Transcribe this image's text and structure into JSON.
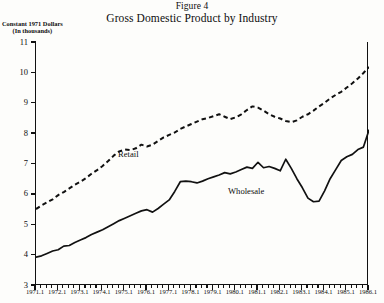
{
  "figure": {
    "number": "Figure 4",
    "title": "Gross Domestic Product by Industry"
  },
  "axes": {
    "y_title_line1": "Constant 1971 Dollars",
    "y_title_line2": "(In thousands)"
  },
  "chart_data": {
    "type": "line",
    "title": "Gross Domestic Product by Industry",
    "subtitle": "Figure 4",
    "xlabel": "",
    "ylabel": "Constant 1971 Dollars (In thousands)",
    "ylim": [
      3,
      11
    ],
    "xlim": [
      "1971.1",
      "1986.1"
    ],
    "y_ticks": [
      3,
      4,
      5,
      6,
      7,
      8,
      9,
      10,
      11
    ],
    "y_tick_labels": [
      "3",
      "4",
      "5",
      "6",
      "7",
      "8",
      "9",
      "10",
      "11"
    ],
    "x_tick_labels": [
      "1971.1",
      "1972.1",
      "1973.1",
      "1974.1",
      "1975.1",
      "1976.1",
      "1977.1",
      "1978.1",
      "1979.1",
      "1980.1",
      "1981.1",
      "1982.1",
      "1983.1",
      "1984.1",
      "1985.1",
      "1986.1"
    ],
    "x_minor_ticks_per_year": 4,
    "grid": false,
    "legend": "inline-annotation",
    "x": [
      "1971.1",
      "1971.2",
      "1971.3",
      "1971.4",
      "1972.1",
      "1972.2",
      "1972.3",
      "1972.4",
      "1973.1",
      "1973.2",
      "1973.3",
      "1973.4",
      "1974.1",
      "1974.2",
      "1974.3",
      "1974.4",
      "1975.1",
      "1975.2",
      "1975.3",
      "1975.4",
      "1976.1",
      "1976.2",
      "1976.3",
      "1976.4",
      "1977.1",
      "1977.2",
      "1977.3",
      "1977.4",
      "1978.1",
      "1978.2",
      "1978.3",
      "1978.4",
      "1979.1",
      "1979.2",
      "1979.3",
      "1979.4",
      "1980.1",
      "1980.2",
      "1980.3",
      "1980.4",
      "1981.1",
      "1981.2",
      "1981.3",
      "1981.4",
      "1982.1",
      "1982.2",
      "1982.3",
      "1982.4",
      "1983.1",
      "1983.2",
      "1983.3",
      "1983.4",
      "1984.1",
      "1984.2",
      "1984.3",
      "1984.4",
      "1985.1",
      "1985.2",
      "1985.3",
      "1985.4",
      "1986.1"
    ],
    "series": [
      {
        "name": "Retail",
        "style": "dashed",
        "color": "#111111",
        "values": [
          5.5,
          5.62,
          5.72,
          5.82,
          5.96,
          6.06,
          6.18,
          6.3,
          6.4,
          6.52,
          6.66,
          6.78,
          6.92,
          7.08,
          7.26,
          7.4,
          7.46,
          7.44,
          7.5,
          7.62,
          7.56,
          7.62,
          7.74,
          7.86,
          7.94,
          8.02,
          8.14,
          8.22,
          8.3,
          8.38,
          8.46,
          8.5,
          8.56,
          8.62,
          8.54,
          8.46,
          8.52,
          8.62,
          8.76,
          8.88,
          8.84,
          8.74,
          8.62,
          8.54,
          8.48,
          8.4,
          8.36,
          8.42,
          8.54,
          8.62,
          8.74,
          8.88,
          9.0,
          9.14,
          9.26,
          9.36,
          9.5,
          9.64,
          9.8,
          9.98,
          10.18
        ]
      },
      {
        "name": "Wholesale",
        "style": "solid",
        "color": "#111111",
        "values": [
          3.92,
          3.96,
          4.04,
          4.12,
          4.16,
          4.28,
          4.3,
          4.4,
          4.48,
          4.56,
          4.66,
          4.74,
          4.82,
          4.92,
          5.02,
          5.12,
          5.2,
          5.28,
          5.36,
          5.44,
          5.48,
          5.4,
          5.52,
          5.66,
          5.8,
          6.08,
          6.4,
          6.42,
          6.4,
          6.36,
          6.42,
          6.5,
          6.56,
          6.62,
          6.7,
          6.66,
          6.72,
          6.8,
          6.88,
          6.84,
          7.04,
          6.86,
          6.9,
          6.84,
          6.76,
          7.14,
          6.84,
          6.5,
          6.2,
          5.86,
          5.74,
          5.76,
          6.1,
          6.5,
          6.8,
          7.1,
          7.22,
          7.3,
          7.46,
          7.54,
          8.1
        ]
      }
    ],
    "annotations": [
      {
        "text": "Retail",
        "x": "1975.2",
        "y": 7.92
      },
      {
        "text": "Wholesale",
        "x": "1981.2",
        "y": 6.05
      }
    ]
  }
}
